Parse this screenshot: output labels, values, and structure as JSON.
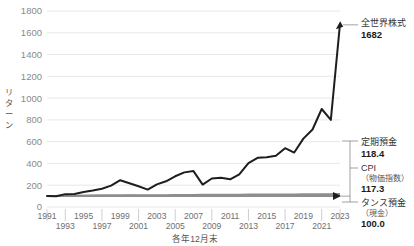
{
  "chart_data": {
    "type": "line",
    "title": "",
    "xlabel": "各年12月末",
    "ylabel": "リターン",
    "ylim": [
      0,
      1800
    ],
    "yticks": [
      0,
      200,
      400,
      600,
      800,
      1000,
      1200,
      1400,
      1600,
      1800
    ],
    "grid": true,
    "legend": "right-annotations",
    "x": [
      1991,
      1992,
      1993,
      1994,
      1995,
      1996,
      1997,
      1998,
      1999,
      2000,
      2001,
      2002,
      2003,
      2004,
      2005,
      2006,
      2007,
      2008,
      2009,
      2010,
      2011,
      2012,
      2013,
      2014,
      2015,
      2016,
      2017,
      2018,
      2019,
      2020,
      2021,
      2022,
      2023
    ],
    "xtick_labels_top": [
      "1991",
      "1995",
      "1999",
      "2003",
      "2007",
      "2011",
      "2015",
      "2019",
      "2023"
    ],
    "xtick_labels_bottom": [
      "1993",
      "1997",
      "2001",
      "2005",
      "2009",
      "2013",
      "2017",
      "2021"
    ],
    "series": [
      {
        "name": "全世界株式",
        "color": "#1e1e1e",
        "end_value": 1682,
        "values": [
          100,
          98,
          118,
          120,
          138,
          152,
          168,
          196,
          246,
          218,
          190,
          160,
          208,
          236,
          282,
          318,
          330,
          206,
          262,
          268,
          254,
          300,
          404,
          452,
          456,
          470,
          540,
          500,
          628,
          712,
          900,
          800,
          1682
        ]
      },
      {
        "name": "定期預金",
        "color": "#8e8e8e",
        "end_value": 118.4,
        "values": [
          100,
          101.5,
          102.7,
          103.6,
          104.3,
          104.9,
          105.5,
          106.1,
          106.6,
          107.1,
          107.6,
          108.0,
          108.4,
          108.9,
          109.4,
          110.0,
          110.7,
          111.4,
          112.0,
          112.5,
          113.0,
          113.4,
          113.8,
          114.2,
          114.6,
          115.0,
          115.4,
          115.9,
          116.4,
          116.9,
          117.4,
          117.9,
          118.4
        ]
      },
      {
        "name": "CPI（物価指数）",
        "color": "#9a9a9a",
        "end_value": 117.3,
        "values": [
          100,
          101.6,
          102.9,
          103.6,
          103.5,
          103.6,
          105.5,
          106.2,
          105.9,
          105.2,
          104.4,
          103.5,
          103.2,
          103.2,
          103.1,
          103.4,
          103.4,
          104.8,
          103.4,
          102.7,
          102.4,
          102.4,
          102.8,
          105.6,
          106.4,
          106.3,
          106.8,
          107.8,
          108.3,
          108.2,
          108.0,
          112.2,
          117.3
        ]
      },
      {
        "name": "タンス預金（現金）",
        "color": "#8e8e8e",
        "end_value": 100.0,
        "values": [
          100,
          100,
          100,
          100,
          100,
          100,
          100,
          100,
          100,
          100,
          100,
          100,
          100,
          100,
          100,
          100,
          100,
          100,
          100,
          100,
          100,
          100,
          100,
          100,
          100,
          100,
          100,
          100,
          100,
          100,
          100,
          100,
          100
        ]
      }
    ]
  },
  "annotations": [
    {
      "id": "world-equity",
      "name": "全世界株式",
      "sub": "",
      "value": "1682"
    },
    {
      "id": "time-deposit",
      "name": "定期預金",
      "sub": "",
      "value": "118.4"
    },
    {
      "id": "cpi",
      "name": "CPI",
      "sub": "（物価指数）",
      "value": "117.3"
    },
    {
      "id": "cash",
      "name": "タンス預金",
      "sub": "（現金）",
      "value": "100.0"
    }
  ],
  "axis": {
    "ylabel": "リターン",
    "ylabel_chars": [
      "リ",
      "タ",
      "ー",
      "ン"
    ],
    "xlabel": "各年12月末",
    "yticks": [
      "1800",
      "1600",
      "1400",
      "1200",
      "1000",
      "800",
      "600",
      "400",
      "200",
      "0"
    ],
    "xticks_top": [
      "1991",
      "1995",
      "1999",
      "2003",
      "2007",
      "2011",
      "2015",
      "2019",
      "2023"
    ],
    "xticks_bottom": [
      "1993",
      "1997",
      "2001",
      "2005",
      "2009",
      "2013",
      "2017",
      "2021"
    ]
  },
  "colors": {
    "series_main": "#1e1e1e",
    "series_flat": "#8e8e8e",
    "grid": "#e2e2e2",
    "text": "#555555",
    "tick_text": "#8a8a8a"
  }
}
